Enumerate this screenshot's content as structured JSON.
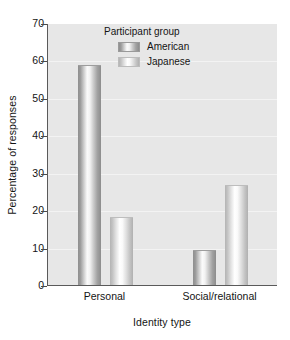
{
  "chart_data": {
    "type": "bar",
    "title": "",
    "xlabel": "Identity type",
    "ylabel": "Percentage of responses",
    "categories": [
      "Personal",
      "Social/relational"
    ],
    "series": [
      {
        "name": "American",
        "values": [
          58.5,
          9
        ]
      },
      {
        "name": "Japanese",
        "values": [
          18,
          26.5
        ]
      }
    ],
    "ylim": [
      0,
      70
    ],
    "yticks": [
      0,
      10,
      20,
      30,
      40,
      50,
      60,
      70
    ],
    "ytick_labels": [
      "0",
      "10",
      "20",
      "30",
      "40",
      "50",
      "60",
      "70"
    ],
    "grid": true,
    "legend": {
      "title": "Participant group",
      "position": "top-center-inside",
      "entries": [
        {
          "label": "American",
          "swatch": "dark-gradient-bar"
        },
        {
          "label": "Japanese",
          "swatch": "light-gradient-bar"
        }
      ]
    },
    "colors": {
      "panel_background": "#e7e7e7",
      "gridline": "#f3f3f3",
      "axis": "#5a5a5a",
      "american_bar": "#9a9a9a",
      "japanese_bar": "#d8d8d8",
      "text": "#141414",
      "figure_background": "#ffffff"
    }
  }
}
